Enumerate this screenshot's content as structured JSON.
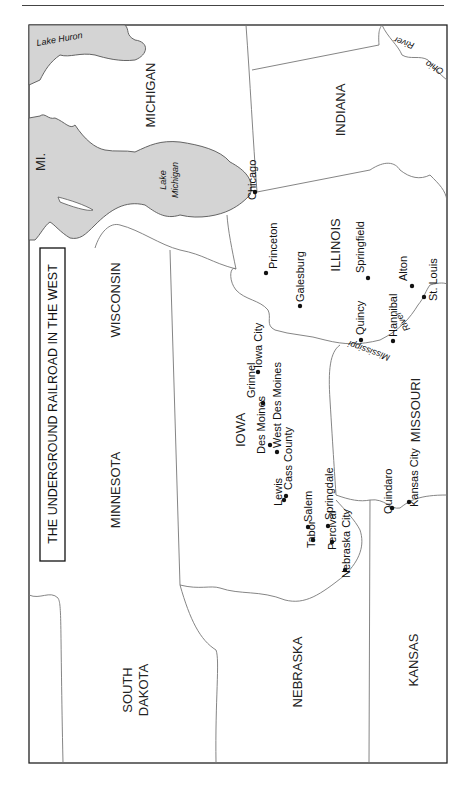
{
  "map": {
    "title": "THE UNDERGROUND RAILROAD IN THE WEST",
    "states": [
      {
        "id": "michigan",
        "label": "MICHIGAN",
        "x": 155,
        "y": 95
      },
      {
        "id": "indiana",
        "label": "INDIANA",
        "x": 345,
        "y": 110
      },
      {
        "id": "wisconsin",
        "label": "WISCONSIN",
        "x": 120,
        "y": 300
      },
      {
        "id": "illinois",
        "label": "ILLINOIS",
        "x": 340,
        "y": 245
      },
      {
        "id": "minnesota",
        "label": "MINNESOTA",
        "x": 120,
        "y": 490
      },
      {
        "id": "iowa",
        "label": "IOWA",
        "x": 245,
        "y": 430
      },
      {
        "id": "missouri",
        "label": "MISSOURI",
        "x": 420,
        "y": 410
      },
      {
        "id": "south-dakota-1",
        "label": "SOUTH",
        "x": 132,
        "y": 690
      },
      {
        "id": "south-dakota-2",
        "label": "DAKOTA",
        "x": 148,
        "y": 690
      },
      {
        "id": "nebraska",
        "label": "NEBRASKA",
        "x": 302,
        "y": 672
      },
      {
        "id": "kansas",
        "label": "KANSAS",
        "x": 418,
        "y": 660
      },
      {
        "id": "michigan-abbr",
        "label": "MI.",
        "x": 45,
        "y": 162
      }
    ],
    "water": [
      {
        "id": "lake-huron",
        "label": "Lake Huron",
        "x": 60,
        "y": 42,
        "rot": -10
      },
      {
        "id": "lake-michigan-1",
        "label": "Lake",
        "x": 166,
        "y": 180,
        "rot": -90
      },
      {
        "id": "lake-michigan-2",
        "label": "Michigan",
        "x": 178,
        "y": 180,
        "rot": -90
      }
    ],
    "rivers": [
      {
        "id": "ohio-river-1",
        "label": "River",
        "x": 405,
        "y": 40,
        "rot": 200
      },
      {
        "id": "ohio-river-2",
        "label": "Ohio",
        "x": 436,
        "y": 65,
        "rot": 210
      },
      {
        "id": "mississippi-river-1",
        "label": "Mississippi",
        "x": 370,
        "y": 348,
        "rot": -160
      },
      {
        "id": "mississippi-river-2",
        "label": "River",
        "x": 405,
        "y": 320,
        "rot": -120
      }
    ],
    "cities": [
      {
        "name": "Chicago",
        "dot": [
          255,
          192
        ],
        "x": 256,
        "y": 200
      },
      {
        "name": "Princeton",
        "dot": [
          266,
          273
        ],
        "x": 277,
        "y": 269
      },
      {
        "name": "Galesburg",
        "dot": [
          300,
          306
        ],
        "x": 304,
        "y": 302
      },
      {
        "name": "Springfield",
        "dot": [
          368,
          278
        ],
        "x": 364,
        "y": 273
      },
      {
        "name": "Quincy",
        "dot": [
          361,
          340
        ],
        "x": 364,
        "y": 335
      },
      {
        "name": "Alton",
        "dot": [
          412,
          286
        ],
        "x": 407,
        "y": 281
      },
      {
        "name": "St. Louis",
        "dot": [
          424,
          297
        ],
        "x": 437,
        "y": 301
      },
      {
        "name": "Hannibal",
        "dot": [
          393,
          341
        ],
        "x": 397,
        "y": 337
      },
      {
        "name": "Iowa City",
        "dot": [
          258,
          372
        ],
        "x": 262,
        "y": 368
      },
      {
        "name": "Grinnel",
        "dot": [
          263,
          403
        ],
        "x": 255,
        "y": 398
      },
      {
        "name": "West Des Moines",
        "dot": [
          277,
          452
        ],
        "x": 281,
        "y": 448
      },
      {
        "name": "Des Moines",
        "dot": [
          270,
          445
        ],
        "x": 265,
        "y": 454
      },
      {
        "name": "Cass County",
        "dot": [
          286,
          496
        ],
        "x": 292,
        "y": 490
      },
      {
        "name": "Lewis",
        "dot": [
          284,
          500
        ],
        "x": 282,
        "y": 506
      },
      {
        "name": "Salem",
        "dot": [
          308,
          527
        ],
        "x": 312,
        "y": 522
      },
      {
        "name": "Springdale",
        "dot": [
          328,
          526
        ],
        "x": 333,
        "y": 520
      },
      {
        "name": "Tabor",
        "dot": [
          313,
          540
        ],
        "x": 315,
        "y": 548
      },
      {
        "name": "Percival",
        "dot": [
          332,
          542
        ],
        "x": 336,
        "y": 550
      },
      {
        "name": "Nebraska City",
        "dot": [
          345,
          570
        ],
        "x": 350,
        "y": 578
      },
      {
        "name": "Quindaro",
        "dot": [
          392,
          508
        ],
        "x": 392,
        "y": 514
      },
      {
        "name": "Kansas City",
        "dot": [
          409,
          502
        ],
        "x": 418,
        "y": 507
      }
    ]
  }
}
